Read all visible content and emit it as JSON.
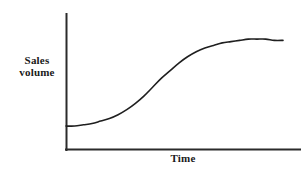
{
  "figure": {
    "background_color": "#ffffff",
    "width": 307,
    "height": 172
  },
  "labels": {
    "ylabel_line1": "Sales",
    "ylabel_line2": "volume",
    "xlabel": "Time"
  },
  "chart_data": {
    "type": "line",
    "title": "",
    "subtitle": "",
    "xlabel": "Time",
    "ylabel": "Sales volume",
    "grid": false,
    "legend": null,
    "legend_position": "none",
    "annotations": [],
    "xlim": [
      0,
      100
    ],
    "ylim": [
      0,
      100
    ],
    "xticks": [],
    "yticks": [],
    "xtick_labels": [],
    "ytick_labels": [],
    "axis_color": "#2b2b2b",
    "line_color": "#1f1f1f",
    "series": [
      {
        "name": "Sales volume",
        "color": "#1f1f1f",
        "x": [
          0,
          4,
          8,
          12,
          16,
          20,
          24,
          28,
          32,
          36,
          40,
          44,
          48,
          52,
          56,
          60,
          64,
          68,
          72,
          76,
          80,
          84,
          88,
          92,
          96,
          100
        ],
        "y": [
          19,
          19,
          20,
          21,
          23,
          25,
          28,
          32,
          37,
          43,
          50,
          57,
          63,
          69,
          74,
          78,
          81,
          83,
          85,
          86,
          87,
          88,
          88,
          88,
          87,
          87
        ]
      }
    ]
  },
  "geometry": {
    "axis_origin_x": 66,
    "axis_origin_y": 150,
    "axis_top_y": 14,
    "axis_right_x": 300,
    "curve_start": [
      66,
      124
    ],
    "curve_inflection": [
      145,
      88
    ],
    "curve_plateau": [
      240,
      48
    ],
    "curve_end": [
      283,
      50
    ]
  }
}
